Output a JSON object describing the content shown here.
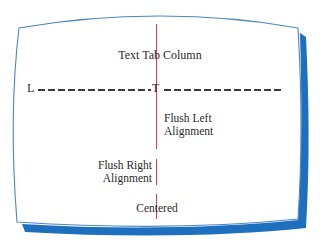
{
  "diagram": {
    "title_label": "Text Tab Column",
    "ruler": {
      "left_marker": "L",
      "tab_marker": "T"
    },
    "alignments": [
      {
        "name": "flush-left",
        "line1": "Flush Left",
        "line2": "Alignment"
      },
      {
        "name": "flush-right",
        "line1": "Flush Right",
        "line2": "Alignment"
      },
      {
        "name": "centered",
        "line1": "Centered"
      }
    ],
    "colors": {
      "frame_outline": "#4a86c8",
      "frame_shadow": "#1f6fbf",
      "tab_line": "#e23a4e",
      "text": "#2b2b2b",
      "screen": "#ffffff"
    }
  }
}
